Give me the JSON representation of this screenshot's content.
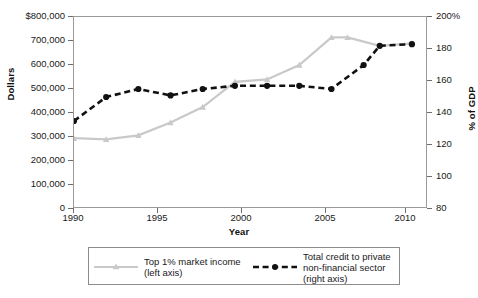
{
  "chart_data": {
    "type": "line",
    "title": "",
    "xlabel": "Year",
    "ylabel": "Dollars",
    "ylabel_right": "% of GDP",
    "grid": false,
    "legend_position": "bottom",
    "xlim": [
      1990,
      2012
    ],
    "xticks": [
      "1990",
      "1995",
      "2000",
      "2005",
      "2010"
    ],
    "ylim_left": [
      0,
      800000
    ],
    "yticks_left": [
      "0",
      "100,000",
      "200,000",
      "300,000",
      "400,000",
      "500,000",
      "600,000",
      "700,000",
      "$800,000"
    ],
    "ylim_right": [
      80,
      200
    ],
    "yticks_right": [
      "80",
      "100",
      "120",
      "140",
      "160",
      "180",
      "200%"
    ],
    "series": [
      {
        "name": "Top 1% market income",
        "axis": "left",
        "axis_note": "(left axis)",
        "color": "#c9c9c9",
        "marker": "triangle",
        "style": "solid",
        "x": [
          1990,
          1992,
          1994,
          1996,
          1998,
          2000,
          2002,
          2004,
          2006,
          2007,
          2009,
          2011
        ],
        "values": [
          295000,
          290000,
          307000,
          360000,
          425000,
          530000,
          540000,
          600000,
          715000,
          715000,
          680000,
          690000
        ]
      },
      {
        "name": "Total credit to private non-financial sector",
        "axis": "right",
        "axis_note": "(right axis)",
        "color": "#111111",
        "marker": "circle",
        "style": "dashed",
        "x": [
          1990,
          1992,
          1994,
          1996,
          1998,
          2000,
          2002,
          2004,
          2006,
          2008,
          2009,
          2011
        ],
        "values": [
          135,
          150,
          155,
          151,
          155,
          157,
          157,
          157,
          155,
          170,
          182,
          183
        ]
      }
    ]
  },
  "axes": {
    "left_title": "Dollars",
    "right_title": "% of GDP",
    "x_title": "Year",
    "y_left_ticks": [
      "$800,000",
      "700,000",
      "600,000",
      "500,000",
      "400,000",
      "300,000",
      "200,000",
      "100,000",
      "0"
    ],
    "y_right_ticks": [
      "200%",
      "180",
      "160",
      "140",
      "120",
      "100",
      "80"
    ],
    "x_ticks": [
      "1990",
      "1995",
      "2000",
      "2005",
      "2010"
    ]
  },
  "legend": {
    "items": [
      {
        "label_line1": "Top 1% market income",
        "label_line2": "(left axis)",
        "label_line3": ""
      },
      {
        "label_line1": "Total credit to private",
        "label_line2": "non-financial sector",
        "label_line3": "(right axis)"
      }
    ]
  }
}
